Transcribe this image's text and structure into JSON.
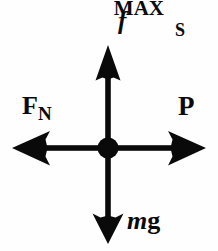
{
  "diagram": {
    "background_color": "#fefefe",
    "ink_color": "#0a0a0a",
    "center": {
      "x": 108,
      "y": 148,
      "dot_radius": 10
    },
    "labels": {
      "friction_base": "f",
      "friction_sub": "S",
      "friction_sup": "MAX",
      "normal_base": "F",
      "normal_sub": "N",
      "applied": "P",
      "weight_italic": "m",
      "weight_upright": "g"
    },
    "vectors": [
      {
        "name": "maximum-static-friction",
        "label": "f_S^MAX",
        "direction": "up",
        "tip": {
          "x": 108,
          "y": 46
        },
        "tail": {
          "x": 108,
          "y": 148
        },
        "length": 102
      },
      {
        "name": "normal-force",
        "label": "F_N",
        "direction": "left",
        "tip": {
          "x": 13,
          "y": 148
        },
        "tail": {
          "x": 108,
          "y": 148
        },
        "length": 95
      },
      {
        "name": "applied-force",
        "label": "P",
        "direction": "right",
        "tip": {
          "x": 205,
          "y": 148
        },
        "tail": {
          "x": 108,
          "y": 148
        },
        "length": 97
      },
      {
        "name": "weight",
        "label": "mg",
        "direction": "down",
        "tip": {
          "x": 108,
          "y": 243
        },
        "tail": {
          "x": 108,
          "y": 148
        },
        "length": 95
      }
    ]
  }
}
